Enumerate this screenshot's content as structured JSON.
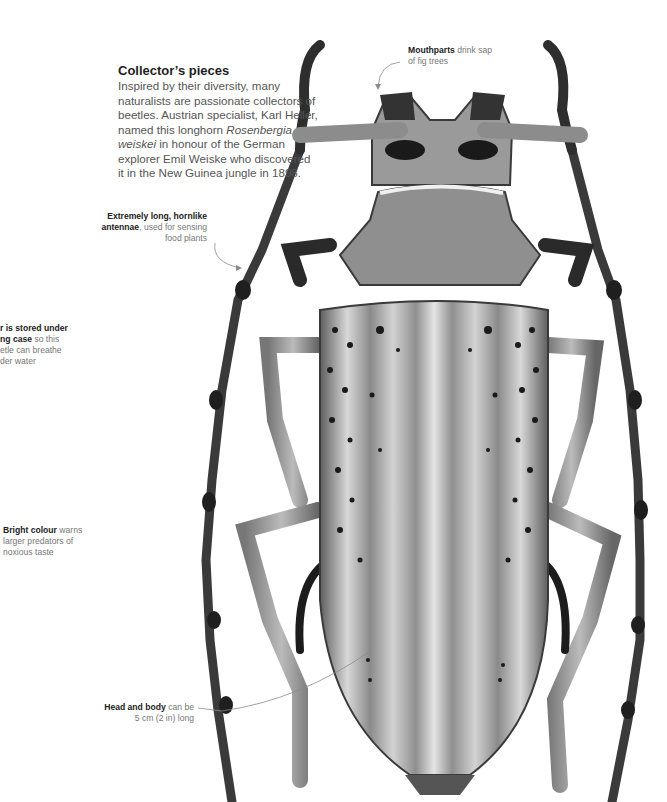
{
  "intro": {
    "title": "Collector’s pieces",
    "text_before_italic": "Inspired by their diversity, many naturalists are passionate collectors of beetles. Austrian specialist, Karl Heller, named this longhorn ",
    "italic": "Rosenbergia weiskei",
    "text_after_italic": " in honour of the German explorer Emil Weiske who discovered it in the New Guinea jungle in 1898."
  },
  "callouts": {
    "mouthparts": {
      "bold": "Mouthparts",
      "rest": " drink sap of fig trees"
    },
    "antennae": {
      "bold": "Extremely long, hornlike antennae",
      "rest": ", used for sensing food plants"
    },
    "air": {
      "bold_1": "r is stored under",
      "bold_2": "ng case",
      "rest": " so this etle can breathe der water"
    },
    "colour": {
      "bold": "Bright colour",
      "rest": " warns larger predators of noxious taste"
    },
    "size": {
      "bold": "Head and body",
      "rest": " can be 5 cm (2 in) long"
    }
  },
  "colors": {
    "shell_light": "#c9c9c9",
    "shell_mid": "#8d8d8d",
    "shell_dark": "#2b2b2b",
    "leader_line": "#8a8a8a"
  }
}
